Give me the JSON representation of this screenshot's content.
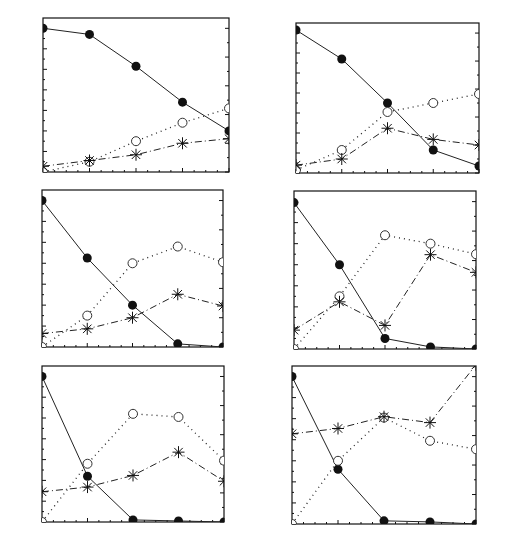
{
  "figure": {
    "x_label": "TIME (h)",
    "y_left_label": "XYLOSE or XYLITOL (g/L)",
    "y_right_label": "CELL CONCENTRATION (g/L)"
  },
  "chart_data": [
    {
      "type": "line",
      "panel": "A",
      "x": [
        0,
        24,
        48,
        72,
        96
      ],
      "xticks": [
        0,
        24,
        48,
        72,
        96
      ],
      "xlim": [
        0,
        96
      ],
      "xlabel": "",
      "ylabel": "XYLOSE or XYLITOL (g/L)",
      "y2label": "CELL CONCENTRATION (g/L)",
      "ylim": [
        0,
        150
      ],
      "yticks": [
        0,
        20,
        40,
        60,
        80,
        100,
        120,
        140
      ],
      "y2lim": [
        0,
        26.8
      ],
      "y2ticks": [
        0,
        5,
        10,
        15,
        20,
        25
      ],
      "grid": false,
      "series": [
        {
          "name": "Xylose",
          "marker": "filled-circle",
          "line": "solid",
          "axis": "left",
          "values": [
            140,
            134,
            103,
            68,
            40
          ]
        },
        {
          "name": "Xylitol",
          "marker": "open-circle",
          "line": "dotted",
          "axis": "left",
          "values": [
            0,
            10,
            30,
            48,
            62
          ]
        },
        {
          "name": "Cell concentration",
          "marker": "asterisk",
          "line": "dash-dot",
          "axis": "right",
          "values": [
            1.0,
            2.0,
            3.0,
            5.0,
            5.8
          ]
        }
      ]
    },
    {
      "type": "line",
      "panel": "B",
      "x": [
        0,
        24,
        48,
        72,
        96
      ],
      "xticks": [
        0,
        24,
        48,
        72,
        96
      ],
      "xlim": [
        0,
        96
      ],
      "xlabel": "",
      "ylabel": "XYLOSE or XYLITOL (g/L)",
      "y2label": "CELL CONCENTRATION (g/L)",
      "ylim": [
        0,
        150
      ],
      "yticks": [
        0,
        20,
        40,
        60,
        80,
        100,
        120,
        140
      ],
      "y2lim": [
        0,
        26.8
      ],
      "y2ticks": [
        0,
        5,
        10,
        15,
        20,
        25
      ],
      "grid": false,
      "series": [
        {
          "name": "Xylose",
          "marker": "filled-circle",
          "line": "solid",
          "axis": "left",
          "values": [
            143,
            114,
            70,
            23,
            7
          ]
        },
        {
          "name": "Xylitol",
          "marker": "open-circle",
          "line": "dotted",
          "axis": "left",
          "values": [
            3,
            23,
            61,
            70,
            79
          ]
        },
        {
          "name": "Cell concentration",
          "marker": "asterisk",
          "line": "dash-dot",
          "axis": "right",
          "values": [
            1.4,
            2.5,
            8.0,
            6.0,
            5.0
          ]
        }
      ]
    },
    {
      "type": "line",
      "panel": "C",
      "x": [
        0,
        24,
        48,
        72,
        96
      ],
      "xticks": [
        0,
        24,
        48,
        72,
        96
      ],
      "xlim": [
        0,
        96
      ],
      "xlabel": "",
      "ylabel": "XYLOSE or XYLITOL (g/L)",
      "y2label": "CELL CONCENTRATION (g/L)",
      "ylim": [
        0,
        150
      ],
      "yticks": [
        0,
        20,
        40,
        60,
        80,
        100,
        120,
        140
      ],
      "y2lim": [
        0,
        26.8
      ],
      "y2ticks": [
        0,
        5,
        10,
        15,
        20,
        25
      ],
      "grid": false,
      "series": [
        {
          "name": "Xylose",
          "marker": "filled-circle",
          "line": "solid",
          "axis": "left",
          "values": [
            140,
            85,
            40,
            3,
            0
          ]
        },
        {
          "name": "Xylitol",
          "marker": "open-circle",
          "line": "dotted",
          "axis": "left",
          "values": [
            0,
            30,
            80,
            96,
            81
          ]
        },
        {
          "name": "Cell concentration",
          "marker": "asterisk",
          "line": "dash-dot",
          "axis": "right",
          "values": [
            2.3,
            3.1,
            5.0,
            9.0,
            7.0
          ]
        }
      ]
    },
    {
      "type": "line",
      "panel": "D",
      "x": [
        0,
        24,
        48,
        72,
        96
      ],
      "xticks": [
        0,
        24,
        48,
        72,
        96
      ],
      "xlim": [
        0,
        96
      ],
      "xlabel": "",
      "ylabel": "XYLOSE or XYLITOL (g/L)",
      "y2label": "CELL CONCENTRATION (g/L)",
      "ylim": [
        0,
        150
      ],
      "yticks": [
        0,
        20,
        40,
        60,
        80,
        100,
        120,
        140
      ],
      "y2lim": [
        0,
        26.8
      ],
      "y2ticks": [
        0,
        5,
        10,
        15,
        20,
        25
      ],
      "grid": false,
      "series": [
        {
          "name": "Xylose",
          "marker": "filled-circle",
          "line": "solid",
          "axis": "left",
          "values": [
            139,
            80,
            10,
            2,
            0
          ]
        },
        {
          "name": "Xylitol",
          "marker": "open-circle",
          "line": "dotted",
          "axis": "left",
          "values": [
            0,
            50,
            108,
            100,
            90
          ]
        },
        {
          "name": "Cell concentration",
          "marker": "asterisk",
          "line": "dash-dot",
          "axis": "right",
          "values": [
            3.2,
            8.0,
            4.0,
            16.0,
            13.0
          ]
        }
      ]
    },
    {
      "type": "line",
      "panel": "E",
      "x": [
        0,
        24,
        48,
        72,
        96
      ],
      "xticks": [
        0,
        24,
        48,
        72,
        96
      ],
      "xlim": [
        0,
        96
      ],
      "xlabel": "TIME (h)",
      "ylabel": "XYLOSE or XYLITOL (g/L)",
      "y2label": "CELL CONCENTRATION (g/L)",
      "ylim": [
        0,
        150
      ],
      "yticks": [
        0,
        20,
        40,
        60,
        80,
        100,
        120,
        140
      ],
      "y2lim": [
        0,
        26.8
      ],
      "y2ticks": [
        0,
        5,
        10,
        15,
        20,
        25
      ],
      "grid": false,
      "series": [
        {
          "name": "Xylose",
          "marker": "filled-circle",
          "line": "solid",
          "axis": "left",
          "values": [
            140,
            44,
            2,
            1,
            0
          ]
        },
        {
          "name": "Xylitol",
          "marker": "open-circle",
          "line": "dotted",
          "axis": "left",
          "values": [
            0,
            56,
            104,
            101,
            59
          ]
        },
        {
          "name": "Cell concentration",
          "marker": "asterisk",
          "line": "dash-dot",
          "axis": "right",
          "values": [
            5.2,
            6.0,
            8.0,
            12.0,
            7.0
          ]
        }
      ]
    },
    {
      "type": "line",
      "panel": "F",
      "x": [
        0,
        24,
        48,
        72,
        96
      ],
      "xticks": [
        0,
        24,
        48,
        72,
        96
      ],
      "xlim": [
        0,
        96
      ],
      "xlabel": "TIME (h)",
      "ylabel": "XYLOSE or XYLITOL (g/L)",
      "y2label": "CELL CONCENTRATION (g/L)",
      "ylim": [
        0,
        150
      ],
      "yticks": [
        0,
        20,
        40,
        60,
        80,
        100,
        120,
        140
      ],
      "y2lim": [
        0,
        26.8
      ],
      "y2ticks": [
        0,
        5,
        10,
        15,
        20,
        25
      ],
      "grid": false,
      "series": [
        {
          "name": "Xylose",
          "marker": "filled-circle",
          "line": "solid",
          "axis": "left",
          "values": [
            140,
            52,
            3,
            2,
            0
          ]
        },
        {
          "name": "Xylitol",
          "marker": "open-circle",
          "line": "dotted",
          "axis": "left",
          "values": [
            0,
            60,
            101,
            79,
            71
          ]
        },
        {
          "name": "Cell concentration",
          "marker": "asterisk",
          "line": "dash-dot",
          "axis": "right",
          "values": [
            15.3,
            16.2,
            18.2,
            17.2,
            27.0
          ]
        }
      ]
    }
  ],
  "layout": {
    "panels": [
      {
        "left": 43,
        "right": 229,
        "top": 18,
        "bottom": 172,
        "show_xlabel": false
      },
      {
        "left": 296,
        "right": 479,
        "top": 23,
        "bottom": 173,
        "show_xlabel": false
      },
      {
        "left": 42,
        "right": 223,
        "top": 190,
        "bottom": 347,
        "show_xlabel": false
      },
      {
        "left": 294,
        "right": 476,
        "top": 191,
        "bottom": 349,
        "show_xlabel": false
      },
      {
        "left": 42,
        "right": 224,
        "top": 366,
        "bottom": 522,
        "show_xlabel": true
      },
      {
        "left": 292,
        "right": 476,
        "top": 366,
        "bottom": 524,
        "show_xlabel": true
      }
    ]
  }
}
